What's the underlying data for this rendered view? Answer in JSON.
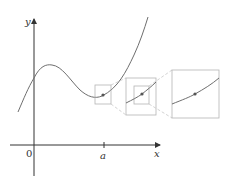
{
  "figure": {
    "labels": {
      "y_axis": "y",
      "x_axis": "x",
      "origin": "0",
      "point_a": "a"
    },
    "colors": {
      "axis": "#333333",
      "curve": "#6e6e6e",
      "box": "#b4b4b4",
      "connector": "#c8c8c8",
      "point": "#555555"
    }
  }
}
